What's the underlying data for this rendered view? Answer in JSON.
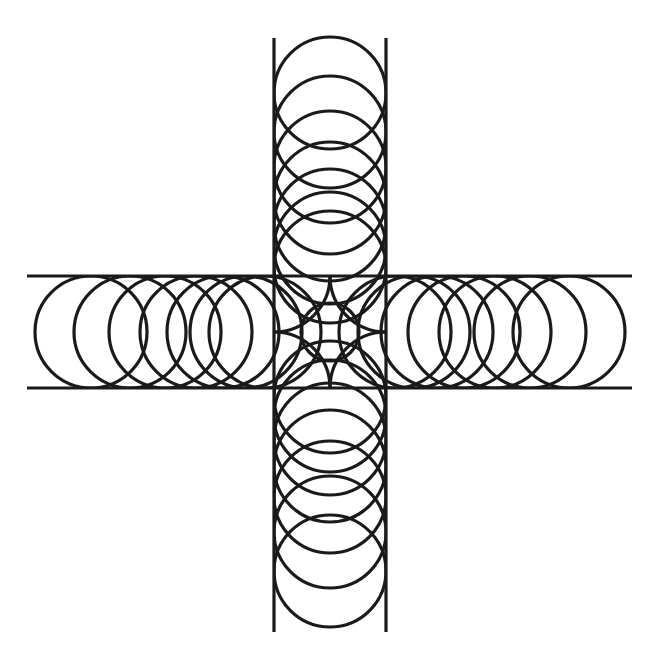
{
  "document": {
    "title": "Geometric Cross Figure",
    "kind": "line-art-diagram",
    "background_color": "#ffffff",
    "stroke_color": "#1a1a1a",
    "canvas": {
      "width": 659,
      "height": 671
    }
  },
  "figure": {
    "name": "orthogonal-band-cross-with-inscribed-circles",
    "stroke_width": 3.2,
    "center": {
      "x": 330,
      "y": 332
    },
    "band_width": 112,
    "circle_radius": 56,
    "horizontal_band": {
      "top_y": 276,
      "bottom_y": 388,
      "start_x": 27,
      "end_x": 632
    },
    "vertical_band": {
      "left_x": 274,
      "right_x": 386,
      "start_y": 38,
      "end_y": 632
    },
    "central_circle": {
      "cx": 330,
      "cy": 332,
      "r": 29
    },
    "corner_circles": [
      {
        "cx": 274,
        "cy": 276,
        "r": 56
      },
      {
        "cx": 386,
        "cy": 276,
        "r": 56
      },
      {
        "cx": 274,
        "cy": 388,
        "r": 56
      },
      {
        "cx": 386,
        "cy": 388,
        "r": 56
      }
    ],
    "arm_circle_centers": {
      "right": [
        395,
        414,
        437,
        464,
        495,
        530,
        569
      ],
      "left": [
        265,
        246,
        223,
        196,
        165,
        130,
        91
      ],
      "down": [
        397,
        416,
        439,
        466,
        497,
        532,
        571
      ],
      "up": [
        267,
        248,
        225,
        198,
        167,
        132,
        93
      ]
    }
  }
}
